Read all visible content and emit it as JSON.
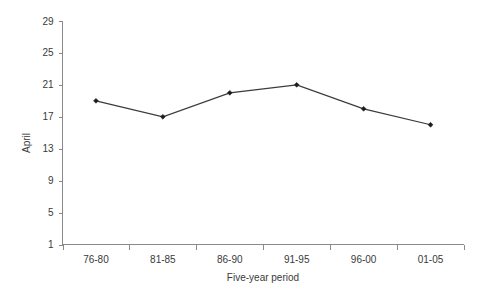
{
  "chart_data": {
    "type": "line",
    "title": "",
    "xlabel": "Five-year period",
    "ylabel": "April",
    "categories": [
      "76-80",
      "81-85",
      "86-90",
      "91-95",
      "96-00",
      "01-05"
    ],
    "values": [
      19,
      17,
      20,
      21,
      18,
      16
    ],
    "series": [
      {
        "name": "April",
        "values": [
          19,
          17,
          20,
          21,
          18,
          16
        ]
      }
    ],
    "ylim": [
      1,
      29
    ],
    "yticks": [
      1,
      5,
      9,
      13,
      17,
      21,
      25,
      29
    ],
    "ytick_labels": [
      "1",
      "5",
      "9",
      "13",
      "17",
      "21",
      "25",
      "29"
    ],
    "xtick_labels": [
      "76-80",
      "81-85",
      "86-90",
      "91-95",
      "96-00",
      "01-05"
    ],
    "grid": false,
    "legend": false,
    "legend_position": "none",
    "marker": "diamond",
    "line_color": "#3b3b3b",
    "marker_color": "#1c1c1c",
    "axis_color": "#8a8a8a",
    "text_color": "#3a3a3a",
    "background_color": "#ffffff"
  },
  "axes": {
    "y_title": "April",
    "x_title": "Five-year period"
  }
}
